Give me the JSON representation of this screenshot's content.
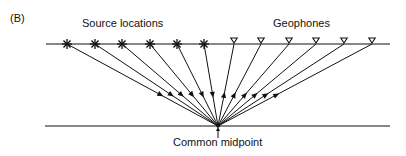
{
  "figure": {
    "panel_label": "(B)",
    "labels": {
      "sources": "Source locations",
      "geophones": "Geophones",
      "midpoint": "Common midpoint"
    },
    "geometry": {
      "surface": {
        "x1": 46,
        "x2": 390,
        "y": 44
      },
      "reflector": {
        "x1": 45,
        "x2": 390,
        "y": 126
      },
      "midpoint": {
        "x": 218,
        "y": 126
      },
      "source_x": [
        67,
        95,
        122,
        150,
        177,
        204
      ],
      "geophone_x": [
        234,
        261,
        289,
        316,
        344,
        372
      ]
    },
    "colors": {
      "ink": "#111111",
      "background": "#ffffff"
    }
  }
}
